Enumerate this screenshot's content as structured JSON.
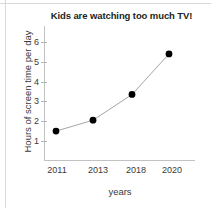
{
  "chart_data": {
    "type": "line",
    "title": "Kids are watching too much TV!",
    "xlabel": "years",
    "ylabel": "Hours of screen time per day",
    "categories": [
      "2011",
      "2013",
      "2018",
      "2020"
    ],
    "x": [
      2011,
      2013,
      2018,
      2020
    ],
    "values": [
      1.5,
      2.05,
      3.35,
      5.4
    ],
    "series": [
      {
        "name": "Hours of screen time per day",
        "values": [
          1.5,
          2.05,
          3.35,
          5.4
        ]
      }
    ],
    "ytick_labels": [
      "1",
      "2",
      "3",
      "4",
      "5",
      "6"
    ],
    "ytick_values": [
      1,
      2,
      3,
      4,
      5,
      6
    ],
    "ylim": [
      0,
      6.8
    ],
    "grid": false,
    "legend": false,
    "marker": "filled-circle",
    "marker_color": "#000000",
    "line_color": "#9a9a9a",
    "axis_color": "#c2c2c2",
    "title_color": "#231f20",
    "background": "#ffffff"
  }
}
